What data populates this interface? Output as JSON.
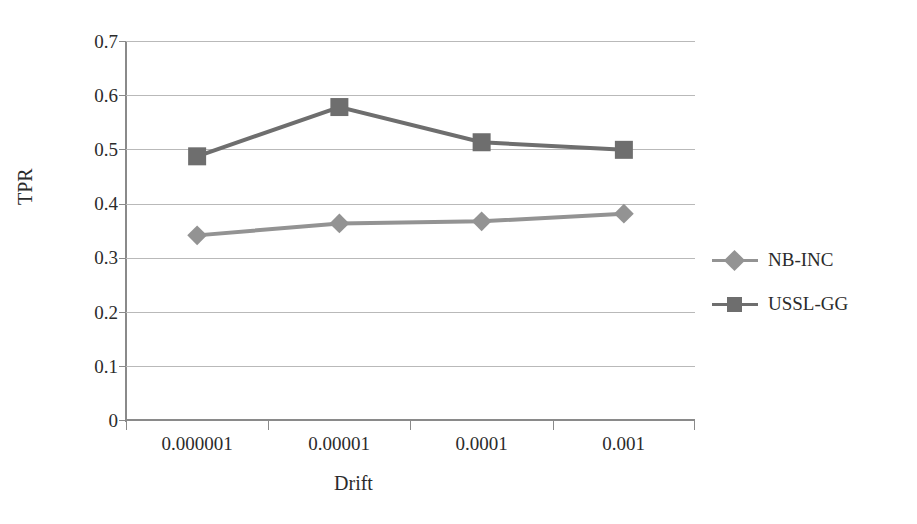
{
  "chart_data": {
    "type": "line",
    "title": "",
    "xlabel": "Drift",
    "ylabel": "TPR",
    "categories": [
      "0.000001",
      "0.00001",
      "0.0001",
      "0.001"
    ],
    "ylim": [
      0,
      0.7
    ],
    "yticks": [
      "0",
      "0.1",
      "0.2",
      "0.3",
      "0.4",
      "0.5",
      "0.6",
      "0.7"
    ],
    "ytick_values": [
      0,
      0.1,
      0.2,
      0.3,
      0.4,
      0.5,
      0.6,
      0.7
    ],
    "grid": "horizontal",
    "legend_position": "right",
    "series": [
      {
        "name": "NB-INC",
        "marker": "diamond",
        "color": "#939393",
        "values": [
          0.341,
          0.363,
          0.367,
          0.381
        ]
      },
      {
        "name": "USSL-GG",
        "marker": "square",
        "color": "#6e6e6e",
        "values": [
          0.487,
          0.578,
          0.513,
          0.499
        ]
      }
    ]
  },
  "colors": {
    "axis": "#8a8a8a",
    "grid": "#b9b9b9",
    "text": "#2b2b2b",
    "series_nb_inc": "#939393",
    "series_ussl_gg": "#6e6e6e"
  }
}
